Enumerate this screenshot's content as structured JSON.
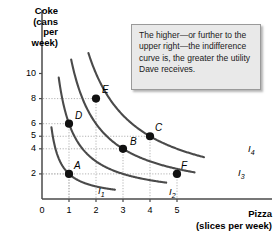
{
  "chart_data": {
    "type": "line",
    "title": "",
    "xlabel": "Pizza",
    "xlabel_sub": "(slices per week)",
    "ylabel_lines": [
      "Coke",
      "(cans",
      "per",
      "week)"
    ],
    "xticks": [
      "0",
      "1",
      "2",
      "3",
      "4",
      "5"
    ],
    "xtick_values": [
      0,
      1,
      2,
      3,
      4,
      5
    ],
    "yticks": [
      "2",
      "4",
      "5",
      "6",
      "8",
      "10"
    ],
    "ytick_values": [
      2,
      4,
      5,
      6,
      8,
      10
    ],
    "xlim": [
      0,
      6.1
    ],
    "ylim": [
      0,
      11.6
    ],
    "grid": "dotted gridlines drawn only to the labeled points",
    "legend_position": "inline at right end of each curve",
    "series": [
      {
        "name": "I1",
        "label": "I",
        "label_sub": "1",
        "utility_constant": 2.0,
        "x_range": [
          0.35,
          2.7
        ],
        "points_on_curve": [
          {
            "label": "A",
            "x": 1,
            "y": 2
          }
        ]
      },
      {
        "name": "I2",
        "label": "I",
        "label_sub": "2",
        "utility_constant": 6.0,
        "x_range": [
          0.62,
          4.6
        ],
        "points_on_curve": [
          {
            "label": "D",
            "x": 1,
            "y": 6
          },
          {
            "label": "E",
            "x": 2,
            "y": 8
          }
        ]
      },
      {
        "name": "I3",
        "label": "I",
        "label_sub": "3",
        "utility_constant": 12.0,
        "x_range": [
          1.08,
          5.65
        ],
        "points_on_curve": [
          {
            "label": "B",
            "x": 3,
            "y": 4
          },
          {
            "label": "F",
            "x": 5,
            "y": 2
          }
        ]
      },
      {
        "name": "I4",
        "label": "I",
        "label_sub": "4",
        "utility_constant": 20.0,
        "x_range": [
          1.72,
          6.0
        ],
        "points_on_curve": [
          {
            "label": "C",
            "x": 4,
            "y": 5
          }
        ]
      }
    ],
    "marked_points": [
      {
        "label": "A",
        "x": 1,
        "y": 2,
        "curve": "I1"
      },
      {
        "label": "D",
        "x": 1,
        "y": 6,
        "curve": "I2"
      },
      {
        "label": "E",
        "x": 2,
        "y": 8,
        "curve": "I2"
      },
      {
        "label": "B",
        "x": 3,
        "y": 4,
        "curve": "I3"
      },
      {
        "label": "F",
        "x": 5,
        "y": 2,
        "curve": "I3"
      },
      {
        "label": "C",
        "x": 4,
        "y": 5,
        "curve": "I4"
      }
    ],
    "annotations": [
      {
        "name": "callout",
        "text": "The higher—or further to the upper right—the indifference curve is, the greater the utility Dave receives."
      }
    ],
    "colors": {
      "curve": "#4a4a4a",
      "axis": "#4a4a4a",
      "grid": "#b3b3b3",
      "marker": "#111111",
      "callout_bg": "#e9e9e9",
      "callout_border": "#9a9a9a",
      "text": "#000000"
    }
  }
}
